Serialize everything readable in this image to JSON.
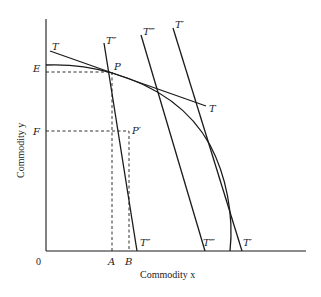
{
  "diagram": {
    "type": "production-possibility-frontier",
    "axes": {
      "x_label": "Commodity x",
      "y_label": "Commodity y",
      "origin_label": "0"
    },
    "points": {
      "P": "P",
      "P_prime": "P′",
      "E": "E",
      "F": "F",
      "A": "A",
      "B": "B"
    },
    "lines": {
      "T_top": "T",
      "T_right": "T",
      "T2_top": "T″",
      "T2_bottom": "T″",
      "T3_top": "T‴",
      "T3_bottom": "T‴",
      "T1_top": "T′",
      "T1_bottom": "T′"
    }
  }
}
